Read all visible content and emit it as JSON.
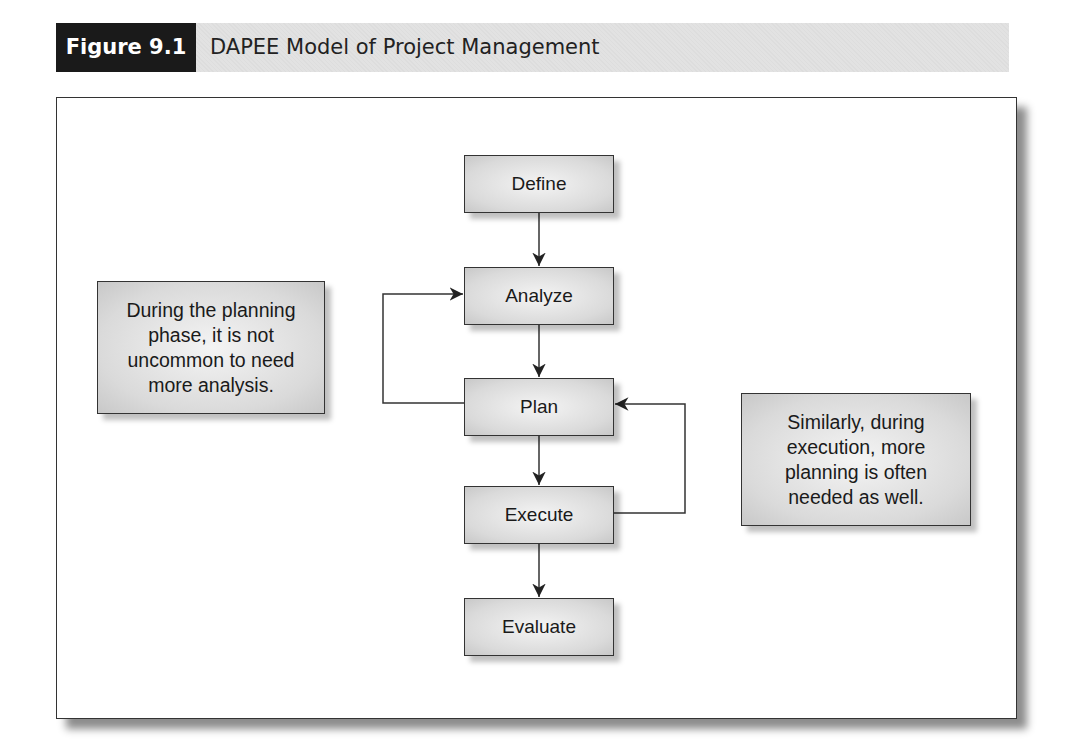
{
  "figure": {
    "label": "Figure 9.1",
    "title": "DAPEE Model of Project Management"
  },
  "steps": [
    {
      "id": "define",
      "label": "Define"
    },
    {
      "id": "analyze",
      "label": "Analyze"
    },
    {
      "id": "plan",
      "label": "Plan"
    },
    {
      "id": "execute",
      "label": "Execute"
    },
    {
      "id": "evaluate",
      "label": "Evaluate"
    }
  ],
  "notes": {
    "left": "During the planning phase, it is not uncommon to need more analysis.",
    "right": "Similarly, during execution, more planning is often needed as well."
  },
  "flows": [
    {
      "from": "Define",
      "to": "Analyze"
    },
    {
      "from": "Analyze",
      "to": "Plan"
    },
    {
      "from": "Plan",
      "to": "Execute"
    },
    {
      "from": "Execute",
      "to": "Evaluate"
    },
    {
      "from": "Plan",
      "to": "Analyze",
      "type": "feedback-loop"
    },
    {
      "from": "Execute",
      "to": "Plan",
      "type": "feedback-loop"
    }
  ],
  "colors": {
    "label_bg": "#1a1a1a",
    "header_bg": "#e2e2e2",
    "box_fill": "#dadada",
    "line": "#333333"
  }
}
